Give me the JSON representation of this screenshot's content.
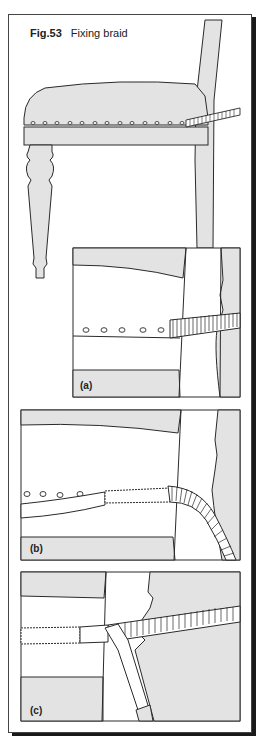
{
  "figure": {
    "number": "Fig.53",
    "title": "Fixing braid"
  },
  "panels": [
    {
      "label": "(a)",
      "description": "close-up: braid starting at back post, nail heads along seat rail"
    },
    {
      "label": "(b)",
      "description": "braid glued along rail, end hanging loose around back post"
    },
    {
      "label": "(c)",
      "description": "braid being pressed into place with a tool handle"
    }
  ],
  "colors": {
    "fill": "#e3e3e3",
    "line": "#2a2a2a",
    "background": "#ffffff",
    "shadow": "#1a1a1a"
  }
}
